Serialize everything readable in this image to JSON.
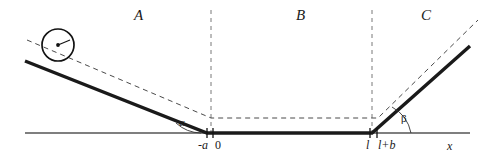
{
  "figure": {
    "background_color": "#ffffff",
    "line_color": "#1a1a1a",
    "axis_color": "#555555",
    "dash_color": "#4a4a4a",
    "width": 482,
    "height": 164
  },
  "regions": [
    {
      "label": "A",
      "x": 134,
      "y": 8
    },
    {
      "label": "B",
      "x": 296,
      "y": 8
    },
    {
      "label": "C",
      "x": 421,
      "y": 8
    }
  ],
  "angles": [
    {
      "label": "α",
      "name": "alpha",
      "x": 179,
      "y": 117
    },
    {
      "label": "β",
      "name": "beta",
      "x": 401,
      "y": 113
    }
  ],
  "axis_ticks": [
    {
      "label": "-a",
      "name": "minus-a",
      "x": 198,
      "y": 139,
      "italic": true
    },
    {
      "label": "0",
      "name": "zero",
      "x": 215,
      "y": 139,
      "italic": false
    },
    {
      "label": "l",
      "name": "l",
      "x": 366,
      "y": 139,
      "italic": true
    },
    {
      "label": "l+b",
      "name": "l-plus-b",
      "x": 378,
      "y": 139,
      "italic": true
    }
  ],
  "axis_name": {
    "label": "x",
    "x": 447,
    "y": 140
  },
  "geometry": {
    "x_axis": {
      "x1": 25,
      "y1": 133,
      "x2": 470,
      "y2": 133
    },
    "track": "M25,61 L207,133 L372,133 L470,46",
    "center_path": "M27,40 L211,118 L378,118 L478,20",
    "vertical_dashes": [
      {
        "x": 211,
        "y1": 10,
        "y2": 133
      },
      {
        "x": 372,
        "y1": 10,
        "y2": 133
      }
    ],
    "ticks": [
      {
        "x": 207,
        "y1": 128,
        "y2": 138
      },
      {
        "x": 213,
        "y1": 128,
        "y2": 138
      },
      {
        "x": 370,
        "y1": 128,
        "y2": 138
      },
      {
        "x": 377,
        "y1": 128,
        "y2": 138
      }
    ],
    "ball": {
      "cx": 58,
      "cy": 45,
      "r": 16
    },
    "alpha_arc": "M201,133 A38,38 0 0,1 176,123",
    "beta_arc": "M411,133 A38,38 0 0,0 392,107"
  }
}
